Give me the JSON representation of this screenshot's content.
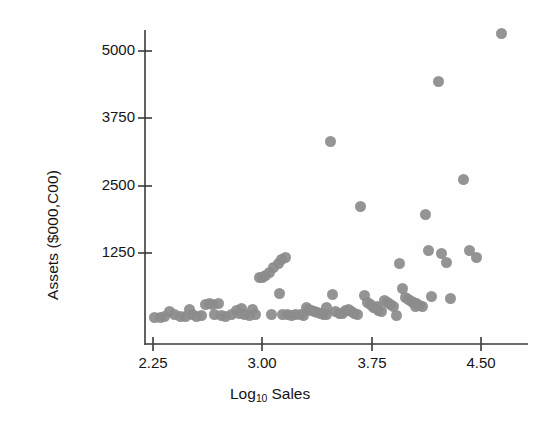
{
  "chart_data": {
    "type": "scatter",
    "title": "",
    "xlabel": "Log10 Sales",
    "xlabel_base": "Log",
    "xlabel_sub": "10",
    "xlabel_rest": " Sales",
    "ylabel": "Assets ($000,C00)",
    "xticks": [
      "2.25",
      "3.00",
      "3.75",
      "4.50"
    ],
    "xtick_values": [
      2.25,
      3.0,
      3.75,
      4.5
    ],
    "yticks": [
      "1250",
      "2500",
      "3750",
      "5000"
    ],
    "ytick_values": [
      1250,
      2500,
      3750,
      5000
    ],
    "xlim": [
      2.15,
      4.78
    ],
    "ylim": [
      0,
      5600
    ],
    "grid": false,
    "legend": false,
    "marker_color": "#8c8c8c",
    "marker_shape": "circle",
    "n_points": 96,
    "points": [
      [
        2.26,
        60
      ],
      [
        2.3,
        55
      ],
      [
        2.36,
        170
      ],
      [
        2.4,
        105
      ],
      [
        2.44,
        80
      ],
      [
        2.47,
        70
      ],
      [
        2.5,
        195
      ],
      [
        2.52,
        105
      ],
      [
        2.55,
        80
      ],
      [
        2.61,
        300
      ],
      [
        2.64,
        320
      ],
      [
        2.66,
        290
      ],
      [
        2.67,
        110
      ],
      [
        2.7,
        320
      ],
      [
        2.72,
        90
      ],
      [
        2.75,
        75
      ],
      [
        2.79,
        100
      ],
      [
        2.82,
        175
      ],
      [
        2.84,
        120
      ],
      [
        2.86,
        215
      ],
      [
        2.88,
        110
      ],
      [
        2.91,
        85
      ],
      [
        2.93,
        200
      ],
      [
        2.95,
        105
      ],
      [
        2.98,
        790
      ],
      [
        3.0,
        800
      ],
      [
        3.02,
        830
      ],
      [
        3.05,
        880
      ],
      [
        3.08,
        980
      ],
      [
        3.11,
        1050
      ],
      [
        3.13,
        1130
      ],
      [
        3.16,
        1170
      ],
      [
        3.12,
        490
      ],
      [
        3.14,
        115
      ],
      [
        3.17,
        100
      ],
      [
        3.2,
        90
      ],
      [
        3.23,
        110
      ],
      [
        3.26,
        100
      ],
      [
        3.28,
        95
      ],
      [
        3.3,
        230
      ],
      [
        3.32,
        205
      ],
      [
        3.34,
        175
      ],
      [
        3.36,
        160
      ],
      [
        3.38,
        145
      ],
      [
        3.4,
        125
      ],
      [
        3.42,
        110
      ],
      [
        3.44,
        105
      ],
      [
        3.47,
        3320
      ],
      [
        3.48,
        480
      ],
      [
        3.5,
        155
      ],
      [
        3.53,
        130
      ],
      [
        3.55,
        120
      ],
      [
        3.57,
        180
      ],
      [
        3.59,
        205
      ],
      [
        3.61,
        160
      ],
      [
        3.63,
        135
      ],
      [
        3.65,
        115
      ],
      [
        3.67,
        2110
      ],
      [
        3.7,
        470
      ],
      [
        3.72,
        340
      ],
      [
        3.74,
        300
      ],
      [
        3.76,
        245
      ],
      [
        3.78,
        215
      ],
      [
        3.8,
        185
      ],
      [
        3.82,
        165
      ],
      [
        3.84,
        370
      ],
      [
        3.86,
        330
      ],
      [
        3.88,
        290
      ],
      [
        3.9,
        260
      ],
      [
        3.92,
        95
      ],
      [
        3.94,
        1060
      ],
      [
        3.96,
        600
      ],
      [
        3.98,
        420
      ],
      [
        4.0,
        380
      ],
      [
        4.02,
        355
      ],
      [
        4.04,
        330
      ],
      [
        4.06,
        310
      ],
      [
        4.08,
        275
      ],
      [
        4.1,
        250
      ],
      [
        4.12,
        1970
      ],
      [
        4.14,
        1290
      ],
      [
        4.16,
        440
      ],
      [
        4.21,
        4430
      ],
      [
        4.23,
        1240
      ],
      [
        4.26,
        1070
      ],
      [
        4.29,
        410
      ],
      [
        4.38,
        2620
      ],
      [
        4.42,
        1300
      ],
      [
        4.47,
        1170
      ],
      [
        4.64,
        5330
      ],
      [
        2.33,
        65
      ],
      [
        2.58,
        95
      ],
      [
        3.06,
        110
      ],
      [
        3.44,
        230
      ],
      [
        3.79,
        260
      ],
      [
        4.05,
        265
      ]
    ]
  },
  "axis": {
    "x_tick_px": [
      153,
      262,
      372,
      481
    ],
    "y_tick_px": [
      253,
      186,
      118,
      51
    ],
    "x_axis_y_px": 344,
    "y_axis_x_px": 145,
    "y_axis_top_px": 30,
    "y_axis_bottom_px": 345,
    "x_axis_left_px": 145,
    "x_axis_right_px": 528
  }
}
